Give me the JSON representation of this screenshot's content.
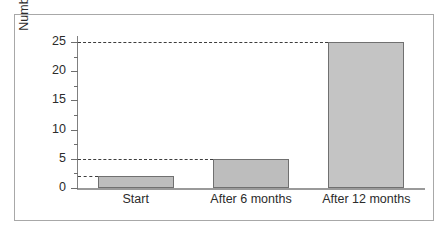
{
  "chart_data": {
    "type": "bar",
    "title": "",
    "xlabel": "",
    "ylabel": "Number of rabbits",
    "categories": [
      "Start",
      "After 6 months",
      "After 12 months"
    ],
    "values": [
      2,
      5,
      25
    ],
    "ylim": [
      0,
      26
    ],
    "yticks": [
      0,
      5,
      10,
      15,
      20,
      25
    ],
    "ytick_labels": [
      "0",
      "5",
      "10",
      "15",
      "20",
      "25"
    ],
    "grid": false,
    "legend": null,
    "annotations": {
      "dashed_reference_lines": [
        2,
        5,
        25
      ]
    },
    "colors": {
      "bar_fill": "#c4c4c4",
      "bar_edge": "#707070",
      "axis": "#808080",
      "dashed_line": "#3d3d3d",
      "frame": "#a8a8a8",
      "text": "#2b2b2b",
      "background": "#ffffff"
    }
  }
}
